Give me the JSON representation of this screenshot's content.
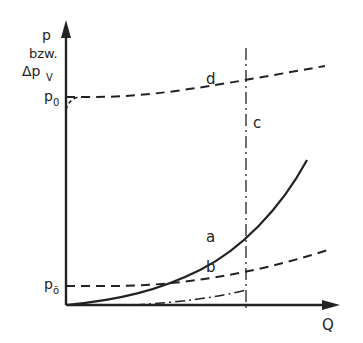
{
  "axes": {
    "y_label_line1": "p",
    "y_label_line2": "bzw.",
    "y_label_line3": "Δp",
    "y_label_sub": "V",
    "x_label": "Q"
  },
  "levels": {
    "upper": "p",
    "upper_sub": "0",
    "lower": "p",
    "lower_sub": "ö"
  },
  "curves": {
    "a": "a",
    "b": "b",
    "c": "c",
    "d": "d"
  },
  "colors": {
    "ink": "#222222",
    "background": "#ffffff"
  }
}
